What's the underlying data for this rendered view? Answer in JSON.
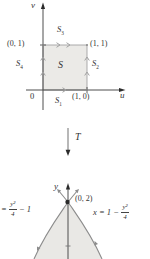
{
  "figure": {
    "uv_plane": {
      "v_axis_label": "v",
      "u_axis_label": "u",
      "origin_label": "0",
      "corner_top_left": "(0, 1)",
      "corner_top_right": "(1, 1)",
      "corner_bottom_right": "(1, 0)",
      "region_label": "S",
      "side_bottom": {
        "base": "S",
        "sub": "1"
      },
      "side_right": {
        "base": "S",
        "sub": "2"
      },
      "side_top": {
        "base": "S",
        "sub": "3"
      },
      "side_left": {
        "base": "S",
        "sub": "4"
      }
    },
    "transform_label": "T",
    "xy_plane": {
      "y_axis_label": "y",
      "vertex_label": "(0, 2)",
      "left_curve_equation": {
        "prefix": "=",
        "numerator": "y²",
        "denominator": "4",
        "suffix": "− 1"
      },
      "right_curve_equation": {
        "prefix": "x = 1 −",
        "numerator": "y²",
        "denominator": "4"
      }
    },
    "colors": {
      "square_fill": "#ebeae7",
      "region_fill": "#e9e8e5",
      "axis_stroke": "#4f4f4f",
      "edge_stroke": "#a2a2a2",
      "curve_stroke": "#8c8c8c",
      "arrow_head": "#2b2b2b",
      "text": "#333333"
    }
  }
}
